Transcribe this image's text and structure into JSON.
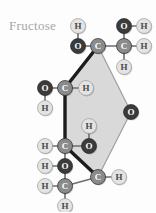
{
  "title": "Fructose",
  "colors": {
    "background": "#fdfdfd",
    "title_text": "#a9a5a2",
    "carbon_fill": "#8b8b8b",
    "carbon_text": "#ffffff",
    "oxygen_fill": "#3b3b3b",
    "oxygen_text": "#ffffff",
    "hydrogen_fill": "#e3e3e3",
    "hydrogen_text": "#4a4a4a",
    "bond": "#6e6e6e",
    "ring_face": "#d9d9d9",
    "ring_front_bond": "#1c1c1c",
    "ring_back_bond": "#9a9a9a"
  },
  "molecule": {
    "name": "Fructose",
    "projection": "Haworth",
    "ring_type": "furanose-style hexagon",
    "ring_vertices": [
      {
        "id": "ring-c2",
        "label": "C",
        "x": 98,
        "y": 46
      },
      {
        "id": "ring-o",
        "label": "O",
        "x": 131,
        "y": 112
      },
      {
        "id": "ring-c5",
        "label": "C",
        "x": 98,
        "y": 177
      },
      {
        "id": "ring-c4",
        "label": "C",
        "x": 65,
        "y": 146
      },
      {
        "id": "ring-c3",
        "label": "C",
        "x": 65,
        "y": 88
      }
    ],
    "atoms": [
      {
        "id": "h-top-left",
        "element": "H",
        "x": 78,
        "y": 26
      },
      {
        "id": "o-top-left",
        "element": "O",
        "x": 78,
        "y": 46
      },
      {
        "id": "c-ring-top",
        "element": "C",
        "x": 98,
        "y": 46
      },
      {
        "id": "c-top-right",
        "element": "C",
        "x": 124,
        "y": 46
      },
      {
        "id": "o-top-right",
        "element": "O",
        "x": 124,
        "y": 26
      },
      {
        "id": "h-top-right-o",
        "element": "H",
        "x": 144,
        "y": 26
      },
      {
        "id": "h-top-right-side",
        "element": "H",
        "x": 144,
        "y": 46
      },
      {
        "id": "h-top-right-below",
        "element": "H",
        "x": 124,
        "y": 67
      },
      {
        "id": "o-left-upper",
        "element": "O",
        "x": 45,
        "y": 88
      },
      {
        "id": "c-ring-upper-left",
        "element": "C",
        "x": 65,
        "y": 88
      },
      {
        "id": "h-ring-upper-right",
        "element": "H",
        "x": 86,
        "y": 88
      },
      {
        "id": "h-left-upper-below",
        "element": "H",
        "x": 45,
        "y": 108
      },
      {
        "id": "h-mid-upper",
        "element": "H",
        "x": 89,
        "y": 126
      },
      {
        "id": "h-ring-lower-left",
        "element": "H",
        "x": 45,
        "y": 146
      },
      {
        "id": "c-ring-lower-left",
        "element": "C",
        "x": 65,
        "y": 146
      },
      {
        "id": "o-mid-lower",
        "element": "O",
        "x": 89,
        "y": 146
      },
      {
        "id": "o-ring-right",
        "element": "O",
        "x": 131,
        "y": 112
      },
      {
        "id": "h-bottom-o-left",
        "element": "H",
        "x": 45,
        "y": 166
      },
      {
        "id": "o-bottom-upper",
        "element": "O",
        "x": 65,
        "y": 166
      },
      {
        "id": "h-bottom-left",
        "element": "H",
        "x": 45,
        "y": 186
      },
      {
        "id": "c-bottom",
        "element": "C",
        "x": 65,
        "y": 186
      },
      {
        "id": "c-ring-bottom",
        "element": "C",
        "x": 98,
        "y": 177
      },
      {
        "id": "h-ring-bottom-right",
        "element": "H",
        "x": 119,
        "y": 177
      },
      {
        "id": "h-bottom-below",
        "element": "H",
        "x": 65,
        "y": 206
      }
    ],
    "bonds": [
      {
        "from": "h-top-left",
        "to": "o-top-left",
        "style": "plain"
      },
      {
        "from": "o-top-left",
        "to": "c-ring-top",
        "style": "plain"
      },
      {
        "from": "c-ring-top",
        "to": "c-top-right",
        "style": "plain"
      },
      {
        "from": "c-top-right",
        "to": "o-top-right",
        "style": "plain"
      },
      {
        "from": "o-top-right",
        "to": "h-top-right-o",
        "style": "plain"
      },
      {
        "from": "c-top-right",
        "to": "h-top-right-side",
        "style": "plain"
      },
      {
        "from": "c-top-right",
        "to": "h-top-right-below",
        "style": "plain"
      },
      {
        "from": "o-left-upper",
        "to": "c-ring-upper-left",
        "style": "plain"
      },
      {
        "from": "o-left-upper",
        "to": "h-left-upper-below",
        "style": "plain"
      },
      {
        "from": "c-ring-upper-left",
        "to": "h-ring-upper-right",
        "style": "plain"
      },
      {
        "from": "c-ring-lower-left",
        "to": "h-ring-lower-left",
        "style": "plain"
      },
      {
        "from": "c-ring-lower-left",
        "to": "o-mid-lower",
        "style": "plain"
      },
      {
        "from": "o-mid-lower",
        "to": "h-mid-upper",
        "style": "plain"
      },
      {
        "from": "c-ring-lower-left",
        "to": "o-bottom-upper",
        "style": "plain"
      },
      {
        "from": "o-bottom-upper",
        "to": "h-bottom-o-left",
        "style": "plain"
      },
      {
        "from": "o-bottom-upper",
        "to": "c-bottom",
        "style": "plain"
      },
      {
        "from": "c-bottom",
        "to": "h-bottom-left",
        "style": "plain"
      },
      {
        "from": "c-bottom",
        "to": "h-bottom-below",
        "style": "plain"
      },
      {
        "from": "c-bottom",
        "to": "c-ring-bottom",
        "style": "plain"
      },
      {
        "from": "c-ring-bottom",
        "to": "h-ring-bottom-right",
        "style": "plain"
      },
      {
        "from": "c-ring-top",
        "to": "c-ring-upper-left",
        "style": "front"
      },
      {
        "from": "c-ring-upper-left",
        "to": "c-ring-lower-left",
        "style": "front"
      },
      {
        "from": "c-ring-lower-left",
        "to": "c-ring-bottom",
        "style": "front"
      },
      {
        "from": "c-ring-top",
        "to": "o-ring-right",
        "style": "back"
      },
      {
        "from": "o-ring-right",
        "to": "c-ring-bottom",
        "style": "back"
      }
    ]
  }
}
